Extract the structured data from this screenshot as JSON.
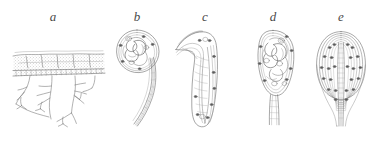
{
  "figure": {
    "type": "scientific-illustration-plate",
    "medium": "ink line drawing",
    "background_color": "#ffffff",
    "ink_color": "#6e6e6e",
    "ink_color_dark": "#4a4a4a",
    "nuclei_color": "#5a5a5a",
    "stipple_color": "#8a8a8a",
    "panel_count": 5,
    "panels": [
      {
        "label": "a",
        "label_x": 53,
        "label_y": 17,
        "caption_letter": "a",
        "subject": "tissue-layer-with-branching-structures",
        "description": "stippled band of tissue with a row of cuboidal cells along its lower margin and dendritic branching processes extending below"
      },
      {
        "label": "b",
        "label_x": 137,
        "label_y": 17,
        "caption_letter": "b",
        "subject": "coiled-larva-in-round-cyst-with-tail",
        "description": "rounded cyst capsule enclosing a tightly coiled larva, with a striated tapering tail extending downward and to the left"
      },
      {
        "label": "c",
        "label_x": 205,
        "label_y": 17,
        "caption_letter": "c",
        "subject": "hook-shaped-elongate-larva",
        "description": "J-shaped elongate body formed of multiple parallel longitudinal lines with a recurved hook at the upper left and scattered dark nuclei"
      },
      {
        "label": "d",
        "label_x": 273,
        "label_y": 17,
        "caption_letter": "d",
        "subject": "oval-cyst-with-coiled-contents-and-stalk",
        "description": "ovoid capsule containing a coiled larva and several vesicles, with dark nuclei in the wall and a short striated stalk below"
      },
      {
        "label": "e",
        "label_x": 341,
        "label_y": 17,
        "caption_letter": "e",
        "subject": "symmetrical-oval-cyst-with-concentric-layers",
        "description": "symmetrical oval enclosed by concentric longitudinal lamellae studded with dark nuclei, with a central axial band and paired stalks below"
      }
    ]
  }
}
